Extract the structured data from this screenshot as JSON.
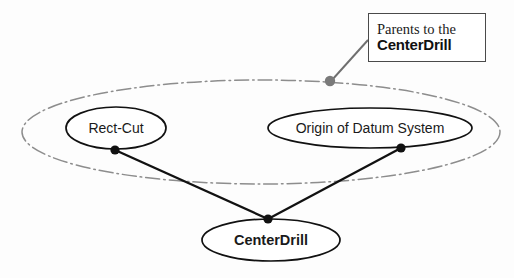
{
  "diagram": {
    "type": "node-link-graph",
    "background_color": "#fdfdfd",
    "nodes": [
      {
        "id": "rect-cut",
        "label": "Rect-Cut",
        "bold": false,
        "cx": 116,
        "cy": 128,
        "rx": 50,
        "ry": 21,
        "stroke": "#111111",
        "text_x": 116,
        "text_y": 129
      },
      {
        "id": "origin-of-datum-system",
        "label": "Origin of Datum System",
        "bold": false,
        "cx": 370,
        "cy": 128,
        "rx": 102,
        "ry": 20,
        "stroke": "#111111",
        "text_x": 370,
        "text_y": 129
      },
      {
        "id": "center-drill",
        "label": "CenterDrill",
        "bold": true,
        "cx": 271,
        "cy": 240,
        "rx": 69,
        "ry": 21,
        "stroke": "#111111",
        "text_x": 271,
        "text_y": 241
      }
    ],
    "grouping_ellipse": {
      "id": "parents-group",
      "cx": 261,
      "cy": 132,
      "rx": 239,
      "ry": 52,
      "stroke": "#8d8d8d",
      "style": "dash-dot"
    },
    "edges": [
      {
        "id": "rect-cut-to-center-drill",
        "from": "rect-cut",
        "to": "center-drill",
        "x1": 115,
        "y1": 150,
        "x2": 268,
        "y2": 219,
        "stroke": "#111111"
      },
      {
        "id": "origin-to-center-drill",
        "from": "origin-of-datum-system",
        "to": "center-drill",
        "x1": 401,
        "y1": 148,
        "x2": 268,
        "y2": 219,
        "stroke": "#111111"
      }
    ],
    "vertex_dots": [
      {
        "id": "rect-cut-vertex-dot",
        "cx": 115,
        "cy": 150,
        "r": 4.6,
        "fill": "#111111"
      },
      {
        "id": "origin-vertex-dot",
        "cx": 401,
        "cy": 148,
        "r": 4.6,
        "fill": "#111111"
      },
      {
        "id": "center-drill-vertex-dot",
        "cx": 268,
        "cy": 219,
        "r": 4.6,
        "fill": "#111111"
      }
    ],
    "leader": {
      "id": "callout-leader",
      "x1": 368,
      "y1": 40,
      "x2": 332,
      "y2": 80,
      "stroke": "#6f6f6f",
      "anchor_dot": {
        "cx": 330,
        "cy": 81,
        "r": 5.2,
        "fill": "#7a7a7a"
      }
    }
  },
  "callout": {
    "line1": "Parents to the",
    "line2": "CenterDrill",
    "border_color": "#4a4a4a"
  }
}
